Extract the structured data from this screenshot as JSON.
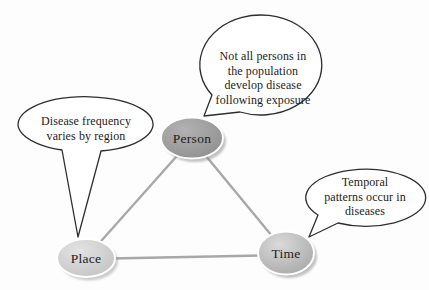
{
  "nodes": {
    "person": {
      "label": "Person"
    },
    "place": {
      "label": "Place"
    },
    "time": {
      "label": "Time"
    }
  },
  "callouts": {
    "person": {
      "lines": [
        "Not all persons in",
        "the population",
        "develop disease",
        "following exposure"
      ]
    },
    "place": {
      "lines": [
        "Disease frequency",
        "varies by region"
      ]
    },
    "time": {
      "lines": [
        "Temporal",
        "patterns occur in",
        "diseases"
      ]
    }
  },
  "colors": {
    "background": "#fdfdfd",
    "triangle_line": "#a8a8a8",
    "callout_fill": "#ffffff",
    "callout_stroke": "#2e2e2e",
    "text": "#1c1c1c",
    "node_ring": "#ffffff",
    "node_shadow": "#8f8f8f",
    "person_light": "#b2b2b2",
    "person_dark": "#8f8f8f",
    "place_light": "#e3e3e3",
    "place_dark": "#c3c3c3",
    "time_light": "#dadada",
    "time_dark": "#a8a8a8"
  }
}
